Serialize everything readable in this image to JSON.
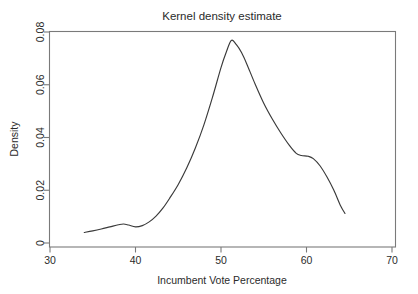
{
  "chart_data": {
    "type": "line",
    "title": "Kernel density estimate",
    "xlabel": "Incumbent Vote Percentage",
    "ylabel": "Density",
    "xlim": [
      30,
      70
    ],
    "ylim": [
      0,
      0.08
    ],
    "grid": false,
    "legend": false,
    "legend_position": "none",
    "xticks": [
      30,
      40,
      50,
      60,
      70
    ],
    "xtick_labels": [
      "30",
      "40",
      "50",
      "60",
      "70"
    ],
    "yticks": [
      0,
      0.02,
      0.04,
      0.06,
      0.08
    ],
    "ytick_labels": [
      "0",
      "0.02",
      "0.04",
      "0.06",
      "0.08"
    ],
    "series": [
      {
        "name": "Kernel density estimate",
        "color": "#3a3a3a",
        "x": [
          34.0,
          35.0,
          36.0,
          37.0,
          38.0,
          38.6,
          39.2,
          40.0,
          40.8,
          41.6,
          42.4,
          43.2,
          44.0,
          45.0,
          46.0,
          47.0,
          48.0,
          49.0,
          50.0,
          50.6,
          51.2,
          51.8,
          52.4,
          53.0,
          54.0,
          55.0,
          56.0,
          57.0,
          58.0,
          58.8,
          59.4,
          60.2,
          60.8,
          61.6,
          62.4,
          63.2,
          64.0,
          64.5
        ],
        "y": [
          0.004,
          0.0046,
          0.0053,
          0.0061,
          0.0069,
          0.0072,
          0.0068,
          0.0061,
          0.0066,
          0.008,
          0.0102,
          0.0132,
          0.017,
          0.0222,
          0.0285,
          0.036,
          0.0448,
          0.0552,
          0.0665,
          0.0722,
          0.0768,
          0.0752,
          0.0722,
          0.068,
          0.0602,
          0.053,
          0.047,
          0.0417,
          0.037,
          0.034,
          0.0332,
          0.0329,
          0.032,
          0.0292,
          0.025,
          0.02,
          0.014,
          0.0112
        ]
      }
    ]
  },
  "figure": {
    "background_color": "#ffffff",
    "axis_color": "#7a7a7a",
    "text_color": "#2b2b2b",
    "curve_color": "#3a3a3a"
  }
}
